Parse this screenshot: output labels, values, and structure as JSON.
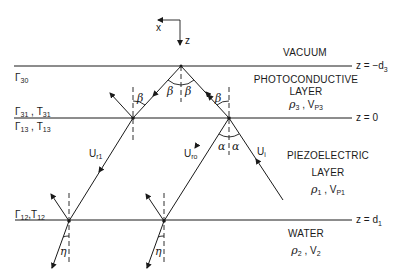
{
  "diagram": {
    "axes": {
      "x_label": "x",
      "z_label": "z"
    },
    "layers": [
      {
        "name": "VACUUM",
        "params": ""
      },
      {
        "name": "PHOTOCONDUCTIVE",
        "name2": "LAYER",
        "rho": "ρ",
        "rho_sub": "3",
        "v": "V",
        "v_sub": "P3"
      },
      {
        "name": "PIEZOELECTRIC",
        "name2": "LAYER",
        "rho": "ρ",
        "rho_sub": "1",
        "v": "V",
        "v_sub": "P1"
      },
      {
        "name": "WATER",
        "rho": "ρ",
        "rho_sub": "2",
        "v": "V",
        "v_sub": "2"
      }
    ],
    "boundaries": [
      {
        "label_prefix": "z = −d",
        "label_sub": "3"
      },
      {
        "label": "z = 0"
      },
      {
        "label_prefix": "z = d",
        "label_sub": "1"
      }
    ],
    "coefficients": {
      "gamma30": {
        "sym": "Γ",
        "sub": "30"
      },
      "gamma31_t31": {
        "sym1": "Γ",
        "sub1": "31",
        "sep": " , ",
        "sym2": "T",
        "sub2": "31"
      },
      "gamma13_t13": {
        "sym1": "Γ",
        "sub1": "13",
        "sep": " , ",
        "sym2": "T",
        "sub2": "13"
      },
      "gamma12_t12": {
        "sym1": "Γ",
        "sub1": "12",
        "sep": ",",
        "sym2": "T",
        "sub2": "12"
      }
    },
    "waves": {
      "incident": {
        "sym": "U",
        "sub": "i"
      },
      "reflected_0": {
        "sym": "U",
        "sub": "ro"
      },
      "reflected_1": {
        "sym": "U",
        "sub": "r1"
      }
    },
    "angles": {
      "beta": "β",
      "alpha": "α",
      "eta": "η"
    },
    "separator": " , "
  }
}
